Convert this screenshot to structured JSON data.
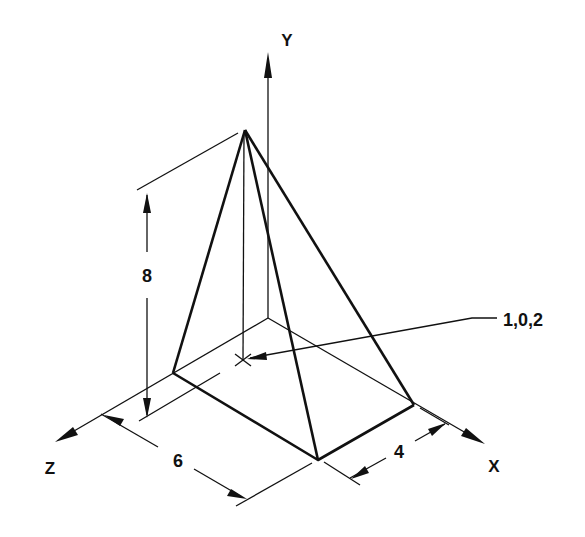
{
  "diagram": {
    "type": "isometric pyramid with coordinate axes",
    "axes": {
      "y_label": "Y",
      "x_label": "X",
      "z_label": "Z"
    },
    "dimensions": {
      "height": "8",
      "width_z": "6",
      "depth_x": "4"
    },
    "apex_callout": "1,0,2",
    "colors": {
      "line": "#111111",
      "background": "#ffffff"
    }
  }
}
